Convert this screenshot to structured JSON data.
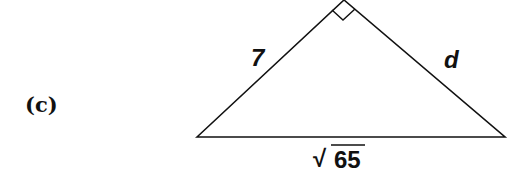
{
  "part_label": "(c)",
  "triangle": {
    "vertices": {
      "left": [
        197,
        137
      ],
      "apex": [
        344,
        0
      ],
      "right": [
        505,
        137
      ]
    },
    "right_angle_at": "apex",
    "sides": {
      "left_leg": "7",
      "right_leg": "d",
      "hypotenuse_radical": "√",
      "hypotenuse_radicand": "65"
    }
  },
  "colors": {
    "stroke": "#111111",
    "background": "#ffffff"
  }
}
